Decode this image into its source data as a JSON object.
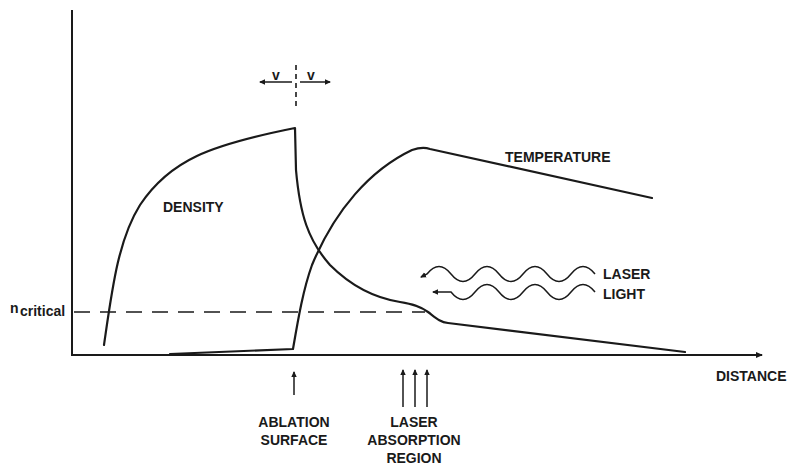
{
  "diagram": {
    "type": "schematic-plot",
    "axes": {
      "x_label": "DISTANCE",
      "y_label": ""
    },
    "curves": [
      {
        "id": "density",
        "label": "DENSITY"
      },
      {
        "id": "temperature",
        "label": "TEMPERATURE"
      }
    ],
    "reference_line": {
      "label_main": "n",
      "label_sub": "critical",
      "style": "dashed"
    },
    "velocity_marker": {
      "left_label": "v",
      "right_label": "v"
    },
    "laser": {
      "line1": "LASER",
      "line2": "LIGHT"
    },
    "annotations": [
      {
        "id": "ablation",
        "lines": [
          "ABLATION",
          "SURFACE"
        ],
        "arrows": 1
      },
      {
        "id": "absorption",
        "lines": [
          "LASER",
          "ABSORPTION",
          "REGION"
        ],
        "arrows": 3
      }
    ]
  },
  "colors": {
    "ink": "#1a1a1a",
    "background": "#ffffff"
  }
}
